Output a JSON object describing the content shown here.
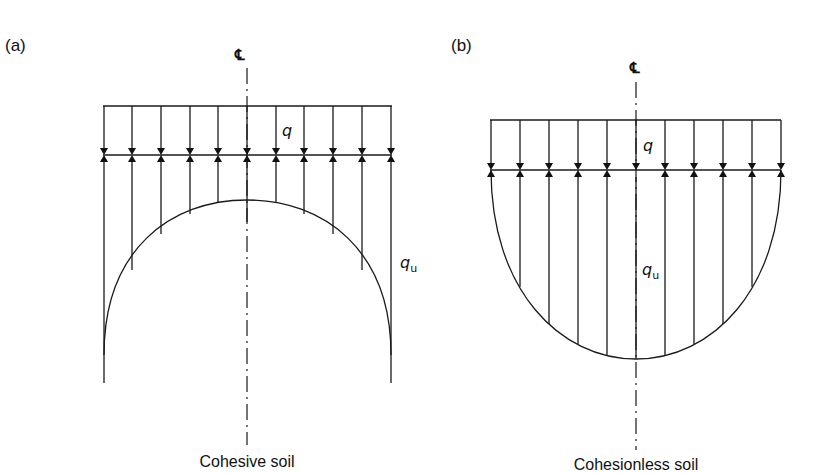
{
  "figure": {
    "panels": [
      {
        "id": "a",
        "label": "(a)",
        "caption": "Cohesive soil",
        "centerline_symbol": "℄",
        "surcharge_symbol": "q",
        "pressure_symbol": "q",
        "pressure_subscript": "u",
        "distribution_shape": "arch (concave down, max at edges)"
      },
      {
        "id": "b",
        "label": "(b)",
        "caption": "Cohesionless soil",
        "centerline_symbol": "℄",
        "surcharge_symbol": "q",
        "pressure_symbol": "q",
        "pressure_subscript": "u",
        "distribution_shape": "bowl (concave up, max at center)"
      }
    ],
    "arrow_count_per_panel": 11,
    "line_color": "#1a1a1a",
    "background": "#ffffff"
  }
}
